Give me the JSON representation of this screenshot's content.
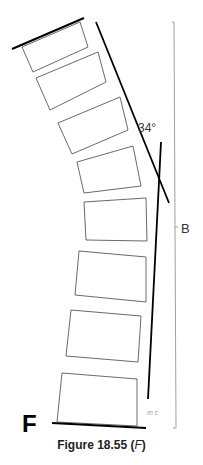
{
  "figure": {
    "panel_label": "F",
    "caption_prefix": "Figure 18.55 (",
    "caption_italic": "F",
    "caption_suffix": ")",
    "angle_label": "34°",
    "bracket_label": "B",
    "scribble": "m c"
  },
  "colors": {
    "line": "#000000",
    "box_outline": "#444444",
    "bracket": "#888888"
  }
}
